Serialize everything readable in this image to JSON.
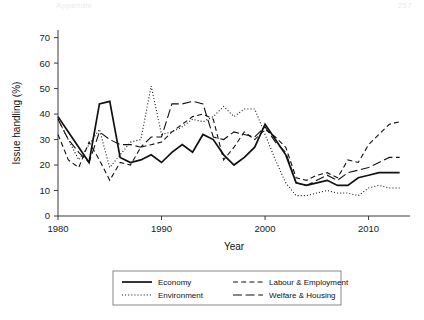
{
  "runninghead": {
    "left": "Appendix",
    "right": "257"
  },
  "chart_data": {
    "type": "line",
    "title": "",
    "xlabel": "Year",
    "ylabel": "Issue handling (%)",
    "xlim": [
      1980,
      2014
    ],
    "ylim": [
      0,
      73
    ],
    "xticks": [
      1980,
      1990,
      2000,
      2010
    ],
    "yticks": [
      0,
      10,
      20,
      30,
      40,
      50,
      60,
      70
    ],
    "grid": false,
    "legend_position": "bottom-center",
    "x": [
      1980,
      1981,
      1982,
      1983,
      1984,
      1985,
      1986,
      1987,
      1988,
      1989,
      1990,
      1991,
      1992,
      1993,
      1994,
      1995,
      1996,
      1997,
      1998,
      1999,
      2000,
      2001,
      2002,
      2003,
      2004,
      2005,
      2006,
      2007,
      2008,
      2009,
      2010,
      2011,
      2012,
      2013
    ],
    "series": [
      {
        "name": "Economy",
        "style": "solid",
        "values": [
          39,
          33,
          27,
          21,
          44,
          45,
          23,
          21,
          22,
          24,
          21,
          25,
          28,
          25,
          32,
          30,
          24,
          20,
          23,
          27,
          36,
          30,
          24,
          13,
          12,
          13,
          14,
          12,
          12,
          15,
          16,
          17,
          17,
          17
        ]
      },
      {
        "name": "Environment",
        "style": "dotted",
        "values": [
          38,
          30,
          22,
          28,
          34,
          19,
          24,
          29,
          30,
          51,
          32,
          33,
          35,
          38,
          37,
          39,
          43,
          39,
          42,
          42,
          32,
          22,
          13,
          8,
          8,
          9,
          10,
          9,
          9,
          8,
          11,
          12,
          11,
          11
        ]
      },
      {
        "name": "Labour & Employment",
        "style": "dashed",
        "values": [
          32,
          22,
          19,
          29,
          22,
          14,
          21,
          20,
          27,
          28,
          29,
          33,
          36,
          39,
          40,
          38,
          22,
          27,
          33,
          30,
          34,
          31,
          27,
          15,
          14,
          16,
          17,
          15,
          22,
          21,
          28,
          32,
          36,
          37
        ]
      },
      {
        "name": "Welfare & Housing",
        "style": "longdash",
        "values": [
          38,
          30,
          25,
          21,
          33,
          30,
          28,
          28,
          27,
          31,
          31,
          44,
          44,
          45,
          44,
          31,
          30,
          33,
          32,
          31,
          35,
          29,
          25,
          13,
          12,
          14,
          16,
          14,
          17,
          18,
          19,
          21,
          23,
          23
        ]
      }
    ]
  },
  "legend": {
    "items": [
      {
        "label": "Economy",
        "style": "solid"
      },
      {
        "label": "Environment",
        "style": "dotted"
      },
      {
        "label": "Labour & Employment",
        "style": "dashed"
      },
      {
        "label": "Welfare & Housing",
        "style": "longdash"
      }
    ]
  }
}
